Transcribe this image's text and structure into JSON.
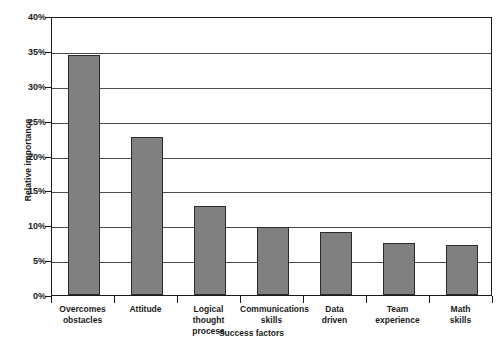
{
  "chart_data": {
    "type": "bar",
    "title": "",
    "xlabel": "Success factors",
    "ylabel": "Relative importance",
    "categories": [
      "Overcomes obstacles",
      "Attitude",
      "Logical thought process",
      "Communications skills",
      "Data driven",
      "Team experience",
      "Math skills"
    ],
    "category_lines": [
      [
        "Overcomes",
        "obstacles"
      ],
      [
        "Attitude",
        ""
      ],
      [
        "Logical",
        "thought process"
      ],
      [
        "Communications",
        "skills"
      ],
      [
        "Data",
        "driven"
      ],
      [
        "Team",
        "experience"
      ],
      [
        "Math",
        "skills"
      ]
    ],
    "values": [
      34.4,
      22.7,
      12.8,
      9.8,
      9.0,
      7.5,
      7.1
    ],
    "ylim": [
      0,
      40
    ],
    "ytick_values": [
      0,
      5,
      10,
      15,
      20,
      25,
      30,
      35,
      40
    ],
    "ytick_labels": [
      "0%",
      "5%",
      "10%",
      "15%",
      "20%",
      "25%",
      "30%",
      "35%",
      "40%"
    ],
    "grid": true,
    "legend": false,
    "bar_color": "#808080",
    "bar_border_color": "#2b2b2b",
    "axis_color": "#1a1a1a",
    "grid_color": "#4a4a4a",
    "background": "#ffffff"
  }
}
